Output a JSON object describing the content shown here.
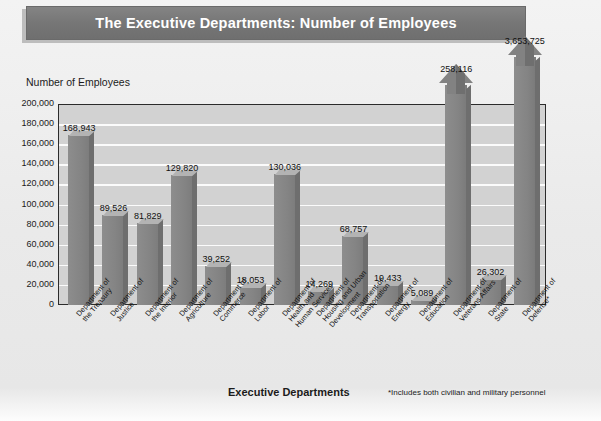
{
  "title": "The Executive Departments: Number of Employees",
  "axis": {
    "y_title": "Number of Employees",
    "x_title": "Executive Departments",
    "footnote": "*Includes both civilian and military personnel"
  },
  "y_ticks": [
    "200,000",
    "180,000",
    "160,000",
    "140,000",
    "120,000",
    "100,000",
    "80,000",
    "60,000",
    "40,000",
    "20,000",
    "0"
  ],
  "chart_data": {
    "type": "bar",
    "title": "The Executive Departments: Number of Employees",
    "xlabel": "Executive Departments",
    "ylabel": "Number of Employees",
    "ylim": [
      0,
      200000
    ],
    "ytick_step": 20000,
    "grid": true,
    "legend": null,
    "annotation": "*Includes both civilian and military personnel",
    "categories": [
      "Department of the Treasury",
      "Department of Justice",
      "Department of the Interior",
      "Department of Agriculture",
      "Department of Commerce",
      "Department of Labor",
      "Department of Health and Human Services",
      "Department of Housing and Urban Development",
      "Department of Transportation",
      "Department of Energy",
      "Department of Education",
      "Department of Veterans Affairs",
      "Department of State",
      "Department of Defense*"
    ],
    "values": [
      168943,
      89526,
      81829,
      129820,
      39252,
      18053,
      130036,
      14269,
      68757,
      19433,
      5089,
      258116,
      26302,
      3653725
    ],
    "value_labels": [
      "168,943",
      "89,526",
      "81,829",
      "129,820",
      "39,252",
      "18,053",
      "130,036",
      "14,269",
      "68,757",
      "19,433",
      "5,089",
      "258,116",
      "26,302",
      "3,653,725"
    ],
    "overflow_bars": [
      "Department of Veterans Affairs",
      "Department of Defense*"
    ]
  },
  "bars": [
    {
      "label": "168,943",
      "lines": [
        "Department of",
        "the Treasury"
      ]
    },
    {
      "label": "89,526",
      "lines": [
        "Department of",
        "Justice"
      ]
    },
    {
      "label": "81,829",
      "lines": [
        "Department of",
        "the Interior"
      ]
    },
    {
      "label": "129,820",
      "lines": [
        "Department of",
        "Agriculture"
      ]
    },
    {
      "label": "39,252",
      "lines": [
        "Department of",
        "Commerce"
      ]
    },
    {
      "label": "18,053",
      "lines": [
        "Department of",
        "Labor"
      ]
    },
    {
      "label": "130,036",
      "lines": [
        "Department of",
        "Health and",
        "Human Services"
      ]
    },
    {
      "label": "14,269",
      "lines": [
        "Department of",
        "Housing and Urban",
        "Development"
      ]
    },
    {
      "label": "68,757",
      "lines": [
        "Department of",
        "Transportation"
      ]
    },
    {
      "label": "19,433",
      "lines": [
        "Department of",
        "Energy"
      ]
    },
    {
      "label": "5,089",
      "lines": [
        "Department of",
        "Education"
      ]
    },
    {
      "label": "258,116",
      "lines": [
        "Department of",
        "Veterans Affairs"
      ]
    },
    {
      "label": "26,302",
      "lines": [
        "Department of",
        "State"
      ]
    },
    {
      "label": "3,653,725",
      "lines": [
        "Department of",
        "Defense*"
      ]
    }
  ],
  "colors": {
    "title_bar": "#7b7b7b",
    "title_text": "#ffffff",
    "plot_bg": "#d2d2d2",
    "gridline": "#fbfbfb",
    "bar_face": "#888888",
    "bar_top": "#b3b3b3",
    "bar_side": "#6e6e6e",
    "page_bg": "#ececec",
    "axis": "#2b2b2b"
  }
}
